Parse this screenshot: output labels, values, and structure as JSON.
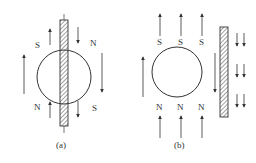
{
  "panels": {
    "a": {
      "caption": "(a)",
      "labels": {
        "top_left": "S",
        "top_right": "N",
        "bottom_left": "N",
        "bottom_right": "S"
      }
    },
    "b": {
      "caption": "(b)",
      "labels": {
        "top": [
          "S",
          "S",
          "S"
        ],
        "bottom": [
          "N",
          "N",
          "N"
        ]
      }
    }
  },
  "colors": {
    "stroke": "#333333",
    "background": "#ffffff"
  }
}
